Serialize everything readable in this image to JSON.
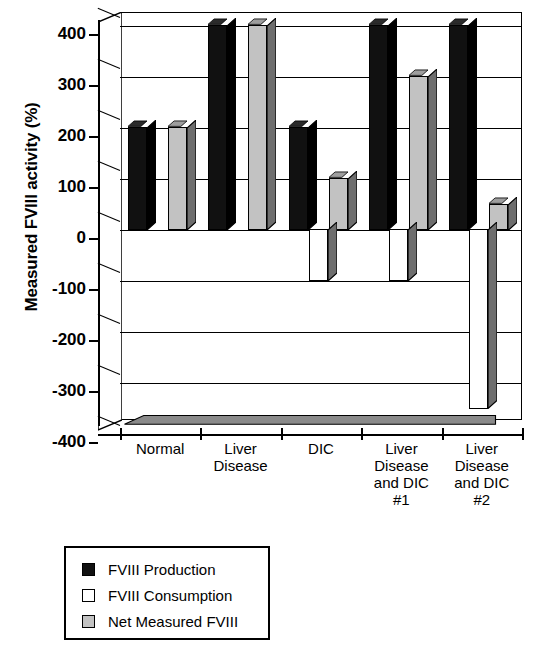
{
  "chart_data": {
    "type": "bar",
    "title": "",
    "xlabel": "",
    "ylabel": "Measured FVIII activity (%)",
    "ylim": [
      -400,
      400
    ],
    "ytick_step": 100,
    "grid": true,
    "legend_position": "below-plot",
    "style": "3d-clustered-column",
    "categories": [
      "Normal",
      "Liver\nDisease",
      "DIC",
      "Liver\nDisease\nand DIC\n#1",
      "Liver\nDisease\nand DIC\n#2"
    ],
    "yticks": [
      "400",
      "300",
      "200",
      "100",
      "0",
      "-100",
      "-200",
      "-300",
      "-400"
    ],
    "series": [
      {
        "name": "FVIII Production",
        "color": "#111111",
        "values": [
          200,
          400,
          200,
          400,
          400
        ]
      },
      {
        "name": "FVIII Consumption",
        "color": "#ffffff",
        "values": [
          0,
          0,
          -100,
          -100,
          -350
        ]
      },
      {
        "name": "Net Measured FVIII",
        "color": "#c2c2c2",
        "values": [
          200,
          400,
          100,
          300,
          50
        ]
      }
    ]
  },
  "legend": {
    "items": [
      {
        "label": "FVIII Production",
        "swatch": "#111111"
      },
      {
        "label": "FVIII Consumption",
        "swatch": "#ffffff"
      },
      {
        "label": "Net Measured FVIII",
        "swatch": "#c2c2c2"
      }
    ]
  }
}
